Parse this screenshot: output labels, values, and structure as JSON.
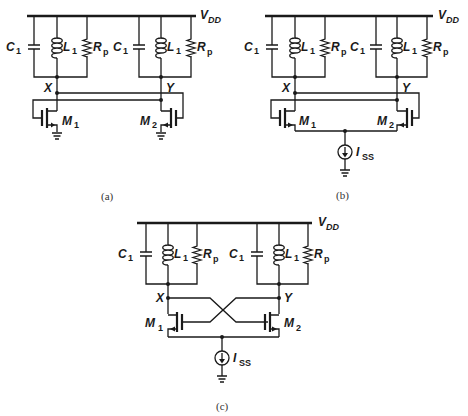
{
  "figure": {
    "colors": {
      "ink": "#1a1a1a",
      "background": "#ffffff"
    },
    "components": {
      "capacitor": {
        "name": "C",
        "sub": "1"
      },
      "inductor": {
        "name": "L",
        "sub": "1"
      },
      "resistor": {
        "name": "R",
        "sub": "p"
      },
      "supply": {
        "name": "V",
        "sub": "DD"
      },
      "transistor_left": {
        "name": "M",
        "sub": "1"
      },
      "transistor_right": {
        "name": "M",
        "sub": "2"
      },
      "current_source": {
        "name": "I",
        "sub": "SS"
      },
      "node_left": "X",
      "node_right": "Y"
    },
    "panels": [
      {
        "id": "a",
        "caption": "(a)",
        "description": "Two tanks, M1/M2 sources grounded, cross-coupled via X and Y lines"
      },
      {
        "id": "b",
        "caption": "(b)",
        "description": "Same as (a) with sources tied to tail current source ISS"
      },
      {
        "id": "c",
        "caption": "(c)",
        "description": "Cross-coupled pair with crossing gate wires and tail current ISS"
      }
    ]
  }
}
